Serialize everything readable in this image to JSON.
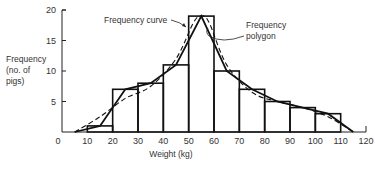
{
  "chart_data": {
    "type": "bar",
    "subtype": "histogram with frequency polygon and frequency curve",
    "title": "",
    "xlabel": "Weight (kg)",
    "ylabel": "Frequency (no. of pigs)",
    "ylabel_lines": [
      "Frequency",
      "(no. of",
      "pigs)"
    ],
    "xlim": [
      0,
      120
    ],
    "ylim": [
      0,
      20
    ],
    "x_ticks": [
      0,
      10,
      20,
      30,
      40,
      50,
      60,
      70,
      80,
      90,
      100,
      110,
      120
    ],
    "x_tick_labels": [
      "0",
      "10",
      "20",
      "30",
      "40",
      "50",
      "60",
      "70",
      "80",
      "90",
      "100",
      "110",
      "120"
    ],
    "y_ticks": [
      5,
      10,
      15,
      20
    ],
    "y_tick_labels": [
      "5",
      "10",
      "15",
      "20"
    ],
    "grid": false,
    "bins": [
      [
        10,
        20
      ],
      [
        20,
        30
      ],
      [
        30,
        40
      ],
      [
        40,
        50
      ],
      [
        50,
        60
      ],
      [
        60,
        70
      ],
      [
        70,
        80
      ],
      [
        80,
        90
      ],
      [
        90,
        100
      ],
      [
        100,
        110
      ]
    ],
    "categories": [
      "10-20",
      "20-30",
      "30-40",
      "40-50",
      "50-60",
      "60-70",
      "70-80",
      "80-90",
      "90-100",
      "100-110"
    ],
    "values": [
      1,
      7,
      8,
      11,
      19,
      10,
      7,
      5,
      4,
      3
    ],
    "series": [
      {
        "name": "Histogram",
        "style": "bars",
        "values": [
          1,
          7,
          8,
          11,
          19,
          10,
          7,
          5,
          4,
          3
        ]
      },
      {
        "name": "Frequency polygon",
        "style": "solid line",
        "x": [
          5,
          15,
          25,
          35,
          45,
          55,
          65,
          75,
          85,
          95,
          105,
          115
        ],
        "y": [
          0,
          1,
          7,
          8,
          11,
          19,
          10,
          7,
          5,
          4,
          3,
          0
        ]
      },
      {
        "name": "Frequency curve",
        "style": "dashed smooth line",
        "x": [
          5,
          15,
          25,
          35,
          45,
          52,
          55,
          58,
          65,
          75,
          85,
          95,
          105,
          115
        ],
        "y": [
          0,
          2.5,
          5.5,
          7.5,
          12,
          18,
          19,
          18,
          11,
          6.5,
          5,
          4,
          2.5,
          0
        ]
      }
    ],
    "annotations": [
      {
        "text": "Frequency curve",
        "points_to": "dashed curve near x=52"
      },
      {
        "text": "Frequency polygon",
        "lines": [
          "Frequency",
          "polygon"
        ],
        "points_to": "solid polygon near x=57"
      }
    ],
    "colors": {
      "line": "#111111",
      "background": "#ffffff"
    }
  }
}
